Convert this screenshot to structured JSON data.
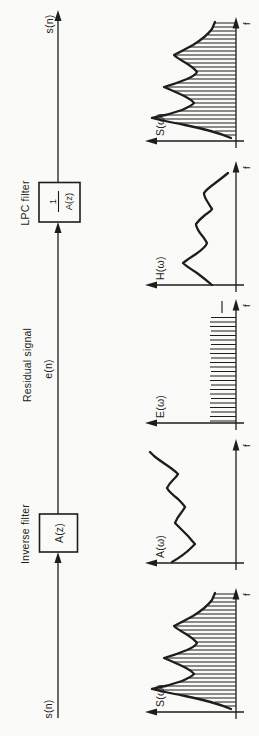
{
  "figure": {
    "flow": {
      "input_label": "s(n)",
      "output_label": "s(n)",
      "inverse_filter_title": "Inverse filter",
      "inverse_filter_box": "A(z)",
      "residual_title": "Residual signal",
      "residual_label": "e(n)",
      "lpc_filter_title": "LPC filter",
      "lpc_numerator": "1",
      "lpc_denominator": "A(z)"
    },
    "spectra": [
      {
        "label": "S(ω)",
        "freq_label": "f",
        "shape": "harmonic comb under formant envelope"
      },
      {
        "label": "A(ω)",
        "freq_label": "f",
        "shape": "inverse formant envelope"
      },
      {
        "label": "E(ω)",
        "freq_label": "f",
        "shape": "flat harmonic comb"
      },
      {
        "label": "H(ω)",
        "freq_label": "f",
        "shape": "smooth formant envelope"
      },
      {
        "label": "S(ω)",
        "freq_label": "f",
        "shape": "harmonic comb under formant envelope"
      }
    ],
    "colors": {
      "ink": "#1d1d1b",
      "paper": "#fafaf8"
    }
  }
}
